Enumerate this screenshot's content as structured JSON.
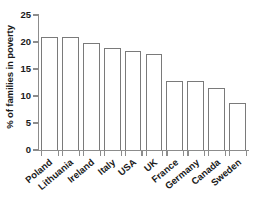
{
  "chart_data": {
    "type": "bar",
    "title": "",
    "subtitle": "",
    "xlabel": "",
    "ylabel": "% of families in poverty",
    "categories": [
      "Poland",
      "Lithuania",
      "Ireland",
      "Italy",
      "USA",
      "UK",
      "France",
      "Germany",
      "Canada",
      "Sweden"
    ],
    "values": [
      20.9,
      20.9,
      19.9,
      18.9,
      18.4,
      17.8,
      12.8,
      12.8,
      11.4,
      8.7
    ],
    "ylim": [
      0,
      25
    ],
    "y_ticks": [
      0,
      5,
      10,
      15,
      20,
      25
    ],
    "y_tick_labels": [
      "0",
      "5",
      "10",
      "15",
      "20",
      "25"
    ],
    "grid": false,
    "legend": false,
    "legend_position": "none",
    "bar_fill_color": "#ffffff",
    "bar_edge_color": "#7a7a7a",
    "axis_color": "#8c8c8c",
    "text_color": "#1a1a1a",
    "background_color": "#ffffff",
    "x_tick_label_rotation": -40
  }
}
